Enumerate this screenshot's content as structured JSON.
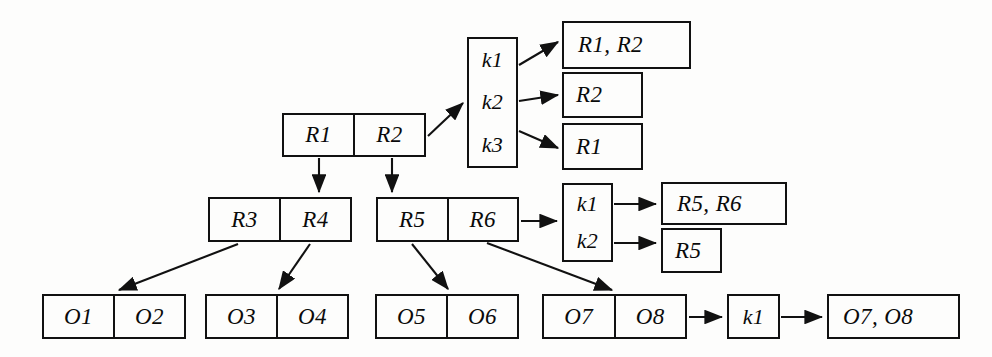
{
  "diagram": {
    "type": "tree-index-diagram",
    "title": "",
    "colors": {
      "stroke": "#111111",
      "background": "#fdfdfc",
      "text": "#0a0a0a"
    },
    "nodes": [
      {
        "id": "root-r1r2",
        "kind": "record-node",
        "orientation": "horizontal",
        "cells": [
          "R1",
          "R2"
        ],
        "x": 282,
        "y": 113,
        "w": 144,
        "h": 44
      },
      {
        "id": "keybox-1",
        "kind": "key-list",
        "orientation": "vertical",
        "cells": [
          "k1",
          "k2",
          "k3"
        ],
        "x": 467,
        "y": 37,
        "w": 51,
        "h": 131
      },
      {
        "id": "result-r1r2",
        "kind": "result-box",
        "orientation": "horizontal",
        "cells": [
          "R1, R2"
        ],
        "x": 562,
        "y": 21,
        "w": 129,
        "h": 48
      },
      {
        "id": "result-r2",
        "kind": "result-box",
        "orientation": "horizontal",
        "cells": [
          "R2"
        ],
        "x": 562,
        "y": 72,
        "w": 81,
        "h": 46
      },
      {
        "id": "result-r1",
        "kind": "result-box",
        "orientation": "horizontal",
        "cells": [
          "R1"
        ],
        "x": 562,
        "y": 123,
        "w": 81,
        "h": 47
      },
      {
        "id": "node-r3r4",
        "kind": "record-node",
        "orientation": "horizontal",
        "cells": [
          "R3",
          "R4"
        ],
        "x": 208,
        "y": 197,
        "w": 144,
        "h": 45
      },
      {
        "id": "node-r5r6",
        "kind": "record-node",
        "orientation": "horizontal",
        "cells": [
          "R5",
          "R6"
        ],
        "x": 376,
        "y": 197,
        "w": 143,
        "h": 45
      },
      {
        "id": "keybox-2",
        "kind": "key-list",
        "orientation": "vertical",
        "cells": [
          "k1",
          "k2"
        ],
        "x": 562,
        "y": 183,
        "w": 51,
        "h": 79
      },
      {
        "id": "result-r5r6",
        "kind": "result-box",
        "orientation": "horizontal",
        "cells": [
          "R5, R6"
        ],
        "x": 661,
        "y": 182,
        "w": 126,
        "h": 43
      },
      {
        "id": "result-r5",
        "kind": "result-box",
        "orientation": "horizontal",
        "cells": [
          "R5"
        ],
        "x": 661,
        "y": 228,
        "w": 61,
        "h": 45
      },
      {
        "id": "leaf-o1o2",
        "kind": "record-node",
        "orientation": "horizontal",
        "cells": [
          "O1",
          "O2"
        ],
        "x": 42,
        "y": 294,
        "w": 144,
        "h": 45
      },
      {
        "id": "leaf-o3o4",
        "kind": "record-node",
        "orientation": "horizontal",
        "cells": [
          "O3",
          "O4"
        ],
        "x": 205,
        "y": 294,
        "w": 144,
        "h": 45
      },
      {
        "id": "leaf-o5o6",
        "kind": "record-node",
        "orientation": "horizontal",
        "cells": [
          "O5",
          "O6"
        ],
        "x": 375,
        "y": 294,
        "w": 144,
        "h": 45
      },
      {
        "id": "leaf-o7o8",
        "kind": "record-node",
        "orientation": "horizontal",
        "cells": [
          "O7",
          "O8"
        ],
        "x": 542,
        "y": 294,
        "w": 145,
        "h": 45
      },
      {
        "id": "keybox-3",
        "kind": "key-list",
        "orientation": "vertical",
        "cells": [
          "k1"
        ],
        "x": 727,
        "y": 294,
        "w": 53,
        "h": 45
      },
      {
        "id": "result-o7o8",
        "kind": "result-box",
        "orientation": "horizontal",
        "cells": [
          "O7, O8"
        ],
        "x": 827,
        "y": 294,
        "w": 133,
        "h": 45
      }
    ],
    "edges": [
      {
        "id": "e-root-to-key1",
        "from": "root-r1r2",
        "to": "keybox-1",
        "path": "M 428,136 L 463,103"
      },
      {
        "id": "e-k1-to-r1r2",
        "from": "keybox-1",
        "to": "result-r1r2",
        "path": "M 519,65 L 558,42"
      },
      {
        "id": "e-k2-to-r2",
        "from": "keybox-1",
        "to": "result-r2",
        "path": "M 519,101 L 558,95"
      },
      {
        "id": "e-k3-to-r1",
        "from": "keybox-1",
        "to": "result-r1",
        "path": "M 519,131 L 558,148"
      },
      {
        "id": "e-r1-down",
        "from": "root-r1r2",
        "to": "node-r3r4",
        "path": "M 319,158 L 319,192"
      },
      {
        "id": "e-r2-down",
        "from": "root-r1r2",
        "to": "node-r5r6",
        "path": "M 392,158 L 392,192"
      },
      {
        "id": "e-r5r6-to-key2",
        "from": "node-r5r6",
        "to": "keybox-2",
        "path": "M 521,221 L 557,221"
      },
      {
        "id": "e-k1-to-r5r6",
        "from": "keybox-2",
        "to": "result-r5r6",
        "path": "M 614,204 L 656,204"
      },
      {
        "id": "e-k2-to-r5",
        "from": "keybox-2",
        "to": "result-r5",
        "path": "M 614,243 L 656,243"
      },
      {
        "id": "e-r3-to-o1o2",
        "from": "node-r3r4",
        "to": "leaf-o1o2",
        "path": "M 238,244 L 119,290"
      },
      {
        "id": "e-r4-to-o3o4",
        "from": "node-r3r4",
        "to": "leaf-o3o4",
        "path": "M 310,244 L 279,289"
      },
      {
        "id": "e-r5-to-o5o6",
        "from": "node-r5r6",
        "to": "leaf-o5o6",
        "path": "M 412,244 L 448,289"
      },
      {
        "id": "e-r6-to-o7o8",
        "from": "node-r5r6",
        "to": "leaf-o7o8",
        "path": "M 487,243 L 612,290"
      },
      {
        "id": "e-o7o8-to-key3",
        "from": "leaf-o7o8",
        "to": "keybox-3",
        "path": "M 689,317 L 722,317"
      },
      {
        "id": "e-k1-to-o7o8",
        "from": "keybox-3",
        "to": "result-o7o8",
        "path": "M 781,317 L 822,317"
      }
    ]
  }
}
